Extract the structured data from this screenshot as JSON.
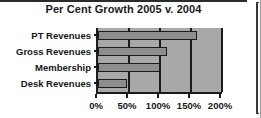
{
  "chart_data": {
    "type": "bar",
    "orientation": "horizontal",
    "title": "Per Cent Growth 2005 v. 2004",
    "xlabel": "",
    "ylabel": "",
    "categories": [
      "PT Revenues",
      "Gross Revenues",
      "Membership",
      "Desk Revenues"
    ],
    "values": [
      160,
      112,
      100,
      47
    ],
    "value_unit": "%",
    "xlim": [
      0,
      200
    ],
    "xticks": [
      0,
      50,
      100,
      150,
      200
    ],
    "xtick_labels": [
      "0%",
      "50%",
      "100%",
      "150%",
      "200%"
    ],
    "grid": true,
    "grid_axis": "x",
    "legend": false,
    "legend_position": "none",
    "colors": {
      "bar_fill": "#8e8e8e",
      "bar_edge": "#1c1c1c",
      "plot_background": "#a8a8a8",
      "figure_background": "#ffffff",
      "axis": "#1c1c1c",
      "text": "#161616"
    }
  },
  "figure": {
    "title": "Per Cent Growth 2005 v. 2004"
  }
}
